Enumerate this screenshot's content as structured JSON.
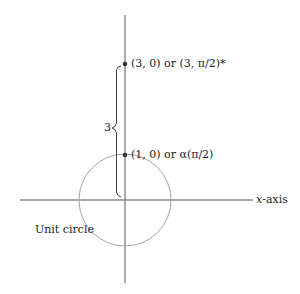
{
  "diagram": {
    "type": "polar-coordinates-illustration",
    "points": [
      {
        "label": "(3, 0) or (3, π/2)*",
        "x": 125,
        "y": 64
      },
      {
        "label": "(1, 0) or α(π/2)",
        "x": 125,
        "y": 155
      }
    ],
    "brace_label": "3",
    "x_axis": {
      "label_var": "x",
      "label_rest": "-axis"
    },
    "circle_label": "Unit circle",
    "colors": {
      "axis": "#555555",
      "circle": "#9a9a9a",
      "text": "#222222",
      "point": "#333333"
    }
  }
}
